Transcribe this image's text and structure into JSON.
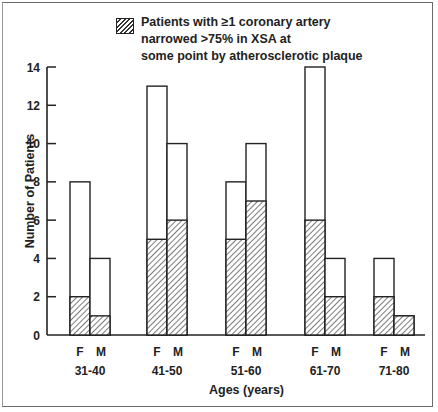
{
  "chart_data": {
    "type": "bar",
    "title": "",
    "xlabel": "Ages (years)",
    "ylabel": "Number of Patients",
    "ylim": [
      0,
      14
    ],
    "yticks": [
      0,
      2,
      4,
      6,
      8,
      10,
      12,
      14
    ],
    "categories": [
      "31-40",
      "41-50",
      "51-60",
      "61-70",
      "71-80"
    ],
    "sub_categories": [
      "F",
      "M"
    ],
    "series": [
      {
        "name": "Total patients",
        "style": "open",
        "F": [
          8,
          13,
          8,
          14,
          4
        ],
        "M": [
          4,
          10,
          10,
          4,
          1
        ]
      },
      {
        "name": "Patients with ≥1 coronary artery narrowed >75% in XSA at some point by atherosclerotic plaque",
        "style": "hatched",
        "F": [
          2,
          5,
          5,
          6,
          2
        ],
        "M": [
          1,
          6,
          7,
          2,
          1
        ]
      }
    ],
    "legend": {
      "position": "top",
      "entries": [
        "Patients with ≥1 coronary artery narrowed >75% in XSA at some point by atherosclerotic plaque"
      ]
    },
    "grid": false
  },
  "legend_text": "Patients with ≥1 coronary artery\nnarrowed >75% in XSA at\nsome point by atherosclerotic plaque",
  "axis": {
    "ylabel": "Number of Patients",
    "xlabel": "Ages (years)"
  }
}
